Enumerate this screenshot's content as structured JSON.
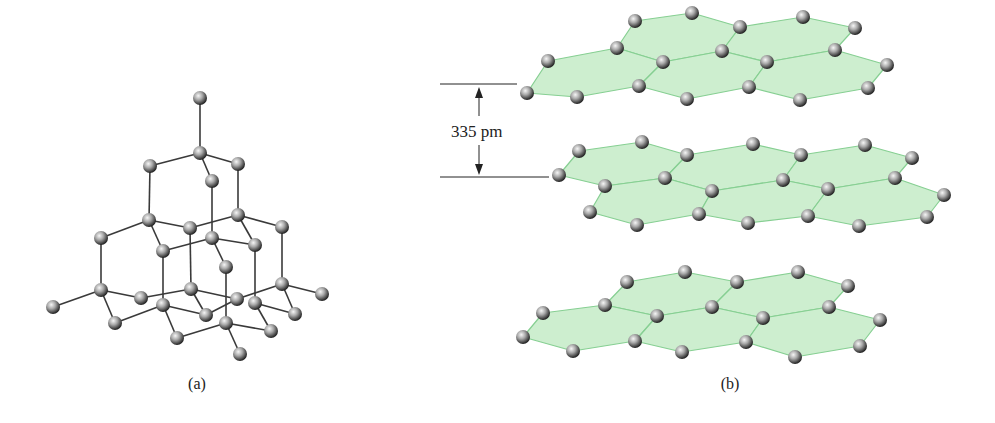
{
  "figure": {
    "panel_a": {
      "caption": "(a)",
      "subject": "diamond lattice",
      "atoms": [
        [
          200,
          98
        ],
        [
          200,
          153
        ],
        [
          150,
          166
        ],
        [
          238,
          164
        ],
        [
          212,
          181
        ],
        [
          149,
          220
        ],
        [
          238,
          215
        ],
        [
          190,
          228
        ],
        [
          282,
          227
        ],
        [
          101,
          238
        ],
        [
          212,
          238
        ],
        [
          163,
          251
        ],
        [
          255,
          245
        ],
        [
          226,
          267
        ],
        [
          101,
          290
        ],
        [
          191,
          289
        ],
        [
          282,
          284
        ],
        [
          53,
          307
        ],
        [
          141,
          298
        ],
        [
          163,
          305
        ],
        [
          237,
          299
        ],
        [
          255,
          303
        ],
        [
          322,
          294
        ],
        [
          115,
          323
        ],
        [
          206,
          315
        ],
        [
          295,
          314
        ],
        [
          226,
          323
        ],
        [
          177,
          338
        ],
        [
          271,
          331
        ],
        [
          240,
          354
        ]
      ],
      "bonds": [
        [
          [
            200,
            98
          ],
          [
            200,
            153
          ]
        ],
        [
          [
            200,
            153
          ],
          [
            150,
            166
          ]
        ],
        [
          [
            200,
            153
          ],
          [
            238,
            164
          ]
        ],
        [
          [
            200,
            153
          ],
          [
            212,
            181
          ]
        ],
        [
          [
            150,
            166
          ],
          [
            149,
            220
          ]
        ],
        [
          [
            238,
            164
          ],
          [
            238,
            215
          ]
        ],
        [
          [
            212,
            181
          ],
          [
            212,
            238
          ]
        ],
        [
          [
            149,
            220
          ],
          [
            190,
            228
          ]
        ],
        [
          [
            149,
            220
          ],
          [
            163,
            251
          ]
        ],
        [
          [
            149,
            220
          ],
          [
            101,
            238
          ]
        ],
        [
          [
            238,
            215
          ],
          [
            190,
            228
          ]
        ],
        [
          [
            238,
            215
          ],
          [
            255,
            245
          ]
        ],
        [
          [
            238,
            215
          ],
          [
            282,
            227
          ]
        ],
        [
          [
            212,
            238
          ],
          [
            163,
            251
          ]
        ],
        [
          [
            212,
            238
          ],
          [
            255,
            245
          ]
        ],
        [
          [
            212,
            238
          ],
          [
            226,
            267
          ]
        ],
        [
          [
            101,
            238
          ],
          [
            101,
            290
          ]
        ],
        [
          [
            190,
            228
          ],
          [
            191,
            289
          ]
        ],
        [
          [
            163,
            251
          ],
          [
            163,
            305
          ]
        ],
        [
          [
            255,
            245
          ],
          [
            255,
            303
          ]
        ],
        [
          [
            282,
            227
          ],
          [
            282,
            284
          ]
        ],
        [
          [
            226,
            267
          ],
          [
            226,
            323
          ]
        ],
        [
          [
            101,
            290
          ],
          [
            53,
            307
          ]
        ],
        [
          [
            101,
            290
          ],
          [
            141,
            298
          ]
        ],
        [
          [
            101,
            290
          ],
          [
            115,
            323
          ]
        ],
        [
          [
            141,
            298
          ],
          [
            191,
            289
          ]
        ],
        [
          [
            191,
            289
          ],
          [
            237,
            299
          ]
        ],
        [
          [
            191,
            289
          ],
          [
            206,
            315
          ]
        ],
        [
          [
            163,
            305
          ],
          [
            115,
            323
          ]
        ],
        [
          [
            163,
            305
          ],
          [
            177,
            338
          ]
        ],
        [
          [
            163,
            305
          ],
          [
            206,
            315
          ]
        ],
        [
          [
            237,
            299
          ],
          [
            206,
            315
          ]
        ],
        [
          [
            237,
            299
          ],
          [
            282,
            284
          ]
        ],
        [
          [
            282,
            284
          ],
          [
            322,
            294
          ]
        ],
        [
          [
            282,
            284
          ],
          [
            295,
            314
          ]
        ],
        [
          [
            255,
            303
          ],
          [
            271,
            331
          ]
        ],
        [
          [
            255,
            303
          ],
          [
            295,
            314
          ]
        ],
        [
          [
            226,
            323
          ],
          [
            177,
            338
          ]
        ],
        [
          [
            226,
            323
          ],
          [
            271,
            331
          ]
        ],
        [
          [
            226,
            323
          ],
          [
            240,
            354
          ]
        ]
      ]
    },
    "panel_b": {
      "caption": "(b)",
      "subject": "graphite layers",
      "spacing_label": "335 pm",
      "layers": [
        {
          "name": "top",
          "hexagons": [
            [
              [
                635,
                21
              ],
              [
                692,
                13
              ],
              [
                740,
                27
              ],
              [
                722,
                51
              ],
              [
                663,
                62
              ],
              [
                617,
                48
              ]
            ],
            [
              [
                740,
                27
              ],
              [
                803,
                17
              ],
              [
                855,
                28
              ],
              [
                835,
                50
              ],
              [
                767,
                62
              ],
              [
                722,
                51
              ]
            ],
            [
              [
                548,
                61
              ],
              [
                617,
                48
              ],
              [
                663,
                62
              ],
              [
                639,
                86
              ],
              [
                577,
                97
              ],
              [
                527,
                93
              ]
            ],
            [
              [
                663,
                62
              ],
              [
                722,
                51
              ],
              [
                767,
                62
              ],
              [
                749,
                87
              ],
              [
                687,
                99
              ],
              [
                639,
                86
              ]
            ],
            [
              [
                767,
                62
              ],
              [
                835,
                50
              ],
              [
                887,
                65
              ],
              [
                868,
                88
              ],
              [
                800,
                100
              ],
              [
                749,
                87
              ]
            ]
          ]
        },
        {
          "name": "middle",
          "hexagons": [
            [
              [
                579,
                151
              ],
              [
                642,
                142
              ],
              [
                687,
                155
              ],
              [
                665,
                178
              ],
              [
                605,
                186
              ],
              [
                559,
                175
              ]
            ],
            [
              [
                687,
                155
              ],
              [
                753,
                144
              ],
              [
                801,
                155
              ],
              [
                783,
                180
              ],
              [
                712,
                191
              ],
              [
                665,
                178
              ]
            ],
            [
              [
                801,
                155
              ],
              [
                865,
                145
              ],
              [
                912,
                158
              ],
              [
                895,
                178
              ],
              [
                828,
                189
              ],
              [
                783,
                180
              ]
            ],
            [
              [
                605,
                186
              ],
              [
                665,
                178
              ],
              [
                712,
                191
              ],
              [
                699,
                214
              ],
              [
                637,
                225
              ],
              [
                590,
                212
              ]
            ],
            [
              [
                712,
                191
              ],
              [
                783,
                180
              ],
              [
                828,
                189
              ],
              [
                808,
                216
              ],
              [
                748,
                223
              ],
              [
                699,
                214
              ]
            ],
            [
              [
                828,
                189
              ],
              [
                895,
                178
              ],
              [
                944,
                195
              ],
              [
                927,
                217
              ],
              [
                859,
                226
              ],
              [
                808,
                216
              ]
            ]
          ]
        },
        {
          "name": "bottom",
          "hexagons": [
            [
              [
                627,
                282
              ],
              [
                685,
                272
              ],
              [
                737,
                282
              ],
              [
                712,
                307
              ],
              [
                657,
                316
              ],
              [
                605,
                305
              ]
            ],
            [
              [
                737,
                282
              ],
              [
                798,
                272
              ],
              [
                848,
                286
              ],
              [
                829,
                307
              ],
              [
                763,
                318
              ],
              [
                712,
                307
              ]
            ],
            [
              [
                543,
                313
              ],
              [
                605,
                305
              ],
              [
                657,
                316
              ],
              [
                635,
                341
              ],
              [
                573,
                351
              ],
              [
                523,
                337
              ]
            ],
            [
              [
                657,
                316
              ],
              [
                712,
                307
              ],
              [
                763,
                318
              ],
              [
                746,
                342
              ],
              [
                682,
                352
              ],
              [
                635,
                341
              ]
            ],
            [
              [
                763,
                318
              ],
              [
                829,
                307
              ],
              [
                880,
                320
              ],
              [
                860,
                346
              ],
              [
                795,
                357
              ],
              [
                746,
                342
              ]
            ]
          ]
        }
      ]
    },
    "colors": {
      "sheet_fill": "#c8ecca",
      "sheet_edge": "#86cf92",
      "bond": "#3a3a3a",
      "atom_light": "#f4f4f4",
      "atom_mid": "#9a9a9a",
      "atom_dark": "#2e2e2e"
    }
  }
}
